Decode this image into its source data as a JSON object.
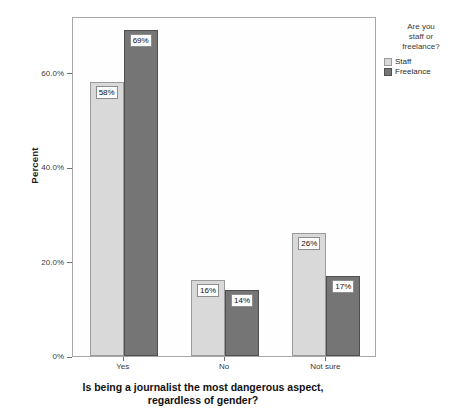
{
  "chart_data": {
    "type": "bar",
    "title": "",
    "xlabel": "Is being a journalist the most dangerous aspect, regardless of gender?",
    "ylabel": "Percent",
    "categories": [
      "Yes",
      "No",
      "Not sure"
    ],
    "series": [
      {
        "name": "Staff",
        "values": [
          58,
          16,
          26
        ],
        "labels": [
          "58%",
          "16%",
          "26%"
        ],
        "color": "#d9d9d9"
      },
      {
        "name": "Freelance",
        "values": [
          69,
          14,
          17
        ],
        "labels": [
          "69%",
          "14%",
          "17%"
        ],
        "color": "#757575"
      }
    ],
    "ylim": [
      0,
      72
    ],
    "yticks": [
      0,
      20,
      40,
      60
    ],
    "ytick_labels": [
      "0%",
      "20.0%",
      "40.0%",
      "60.0%"
    ],
    "grid": false,
    "legend_position": "right",
    "legend": {
      "title": "Are you staff or freelance?",
      "entries": [
        "Staff",
        "Freelance"
      ]
    }
  },
  "axes": {
    "y_title": "Percent",
    "x_title_line1": "Is being a journalist the most dangerous aspect,",
    "x_title_line2": "regardless of gender?",
    "y_ticks": [
      {
        "label": "60.0%",
        "value": 60
      },
      {
        "label": "40.0%",
        "value": 40
      },
      {
        "label": "20.0%",
        "value": 20
      },
      {
        "label": "0%",
        "value": 0
      }
    ],
    "x_categories": [
      "Yes",
      "No",
      "Not sure"
    ]
  },
  "legend": {
    "title_line1": "Are you",
    "title_line2": "staff or",
    "title_line3": "freelance?",
    "items": [
      {
        "label": "Staff",
        "color": "#d9d9d9"
      },
      {
        "label": "Freelance",
        "color": "#757575"
      }
    ]
  },
  "bars": [
    {
      "group": "Yes",
      "series": "Staff",
      "value": 58,
      "label": "58%"
    },
    {
      "group": "Yes",
      "series": "Freelance",
      "value": 69,
      "label": "69%"
    },
    {
      "group": "No",
      "series": "Staff",
      "value": 16,
      "label": "16%"
    },
    {
      "group": "No",
      "series": "Freelance",
      "value": 14,
      "label": "14%"
    },
    {
      "group": "Not sure",
      "series": "Staff",
      "value": 26,
      "label": "26%"
    },
    {
      "group": "Not sure",
      "series": "Freelance",
      "value": 17,
      "label": "17%"
    }
  ]
}
